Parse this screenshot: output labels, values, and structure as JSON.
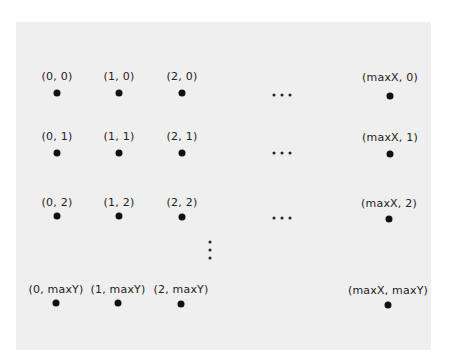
{
  "diagram": {
    "title": "",
    "background_color": "#efefef",
    "dot_color": "#111111",
    "points": [
      {
        "label": "(0, 0)",
        "x": 57,
        "y": 93,
        "ly": 71
      },
      {
        "label": "(1, 0)",
        "x": 119,
        "y": 93,
        "ly": 71
      },
      {
        "label": "(2, 0)",
        "x": 182,
        "y": 93,
        "ly": 71
      },
      {
        "label": "(maxX, 0)",
        "x": 390,
        "y": 96,
        "ly": 72
      },
      {
        "label": "(0, 1)",
        "x": 57,
        "y": 153,
        "ly": 131
      },
      {
        "label": "(1, 1)",
        "x": 119,
        "y": 153,
        "ly": 131
      },
      {
        "label": "(2, 1)",
        "x": 182,
        "y": 153,
        "ly": 131
      },
      {
        "label": "(maxX, 1)",
        "x": 390,
        "y": 154,
        "ly": 132
      },
      {
        "label": "(0, 2)",
        "x": 57,
        "y": 216,
        "ly": 197
      },
      {
        "label": "(1, 2)",
        "x": 119,
        "y": 216,
        "ly": 197
      },
      {
        "label": "(2, 2)",
        "x": 182,
        "y": 217,
        "ly": 197
      },
      {
        "label": "(maxX, 2)",
        "x": 389,
        "y": 219,
        "ly": 198
      },
      {
        "label": "(0, maxY)",
        "x": 56,
        "y": 303,
        "ly": 284
      },
      {
        "label": "(1, maxY)",
        "x": 118,
        "y": 303,
        "ly": 284
      },
      {
        "label": "(2, maxY)",
        "x": 181,
        "y": 304,
        "ly": 284
      },
      {
        "label": "(maxX, maxY)",
        "x": 388,
        "y": 305,
        "ly": 285
      }
    ],
    "horizontal_ellipses": [
      {
        "x": 282,
        "y": 95
      },
      {
        "x": 282,
        "y": 153
      },
      {
        "x": 282,
        "y": 218
      }
    ],
    "vertical_ellipsis": {
      "x": 210,
      "y": 250
    }
  }
}
